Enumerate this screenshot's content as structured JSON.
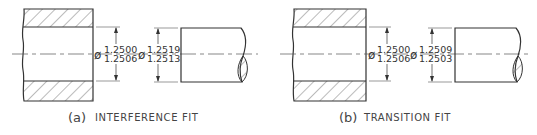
{
  "figures": [
    {
      "id": "a",
      "label": "(a)",
      "caption": "INTERFERENCE FIT",
      "hole": {
        "symbol": "ø",
        "upper": "1.2500",
        "lower": "1.2506"
      },
      "shaft": {
        "symbol": "ø",
        "upper": "1.2519",
        "lower": "1.2513"
      }
    },
    {
      "id": "b",
      "label": "(b)",
      "caption": "TRANSITION FIT",
      "hole": {
        "symbol": "ø",
        "upper": "1.2500",
        "lower": "1.2506"
      },
      "shaft": {
        "symbol": "ø",
        "upper": "1.2509",
        "lower": "1.2503"
      }
    }
  ],
  "colors": {
    "line": "#333333",
    "hatch": "#555555",
    "background": "#ffffff"
  }
}
